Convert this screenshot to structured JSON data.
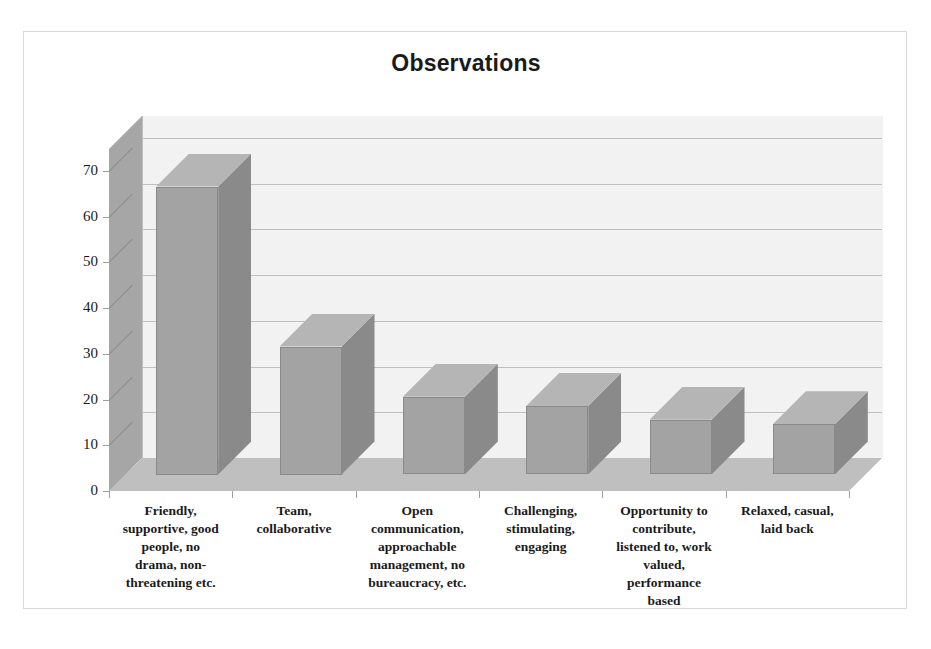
{
  "chart_data": {
    "type": "bar",
    "title": "Observations",
    "xlabel": "",
    "ylabel": "",
    "ylim": [
      0,
      70
    ],
    "yticks": [
      0,
      10,
      20,
      30,
      40,
      50,
      60,
      70
    ],
    "grid": true,
    "legend": false,
    "three_d": true,
    "categories": [
      "Friendly, supportive, good people, no drama, non-threatening etc.",
      "Team, collaborative",
      "Open communication, approachable management, no bureaucracy, etc.",
      "Challenging, stimulating, engaging",
      "Opportunity to contribute, listened to, work valued, performance based",
      "Relaxed, casual, laid back"
    ],
    "category_lines": [
      [
        "Friendly,",
        "supportive, good",
        "people, no",
        "drama, non-",
        "threatening etc."
      ],
      [
        "Team,",
        "collaborative"
      ],
      [
        "Open",
        "communication,",
        "approachable",
        "management, no",
        "bureaucracy, etc."
      ],
      [
        "Challenging,",
        "stimulating,",
        "engaging"
      ],
      [
        "Opportunity to",
        "contribute,",
        "listened to, work",
        "valued,",
        "performance",
        "based"
      ],
      [
        "Relaxed, casual,",
        "laid back"
      ]
    ],
    "values": [
      63,
      28,
      17,
      15,
      12,
      11
    ],
    "colors": {
      "bar_front": "#a3a3a3",
      "bar_side": "#8a8a8a",
      "bar_top": "#b5b5b5",
      "plot_back_wall": "#f2f2f2",
      "plot_side_wall": "#a6a6a6",
      "plot_floor": "#bfbfbf",
      "gridline": "#bfbfbf",
      "text": "#1a1a1a",
      "frame_border": "#d9d9d9"
    }
  }
}
